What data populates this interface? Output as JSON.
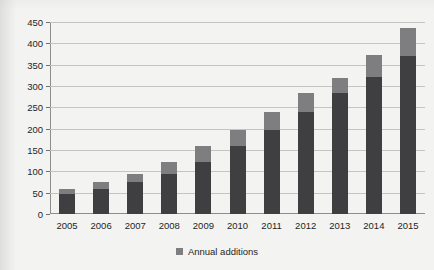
{
  "chart_data": {
    "type": "bar",
    "stacked": true,
    "title": "",
    "xlabel": "",
    "ylabel": "Wind power capacity (GW)",
    "categories": [
      "2005",
      "2006",
      "2007",
      "2008",
      "2009",
      "2010",
      "2011",
      "2012",
      "2013",
      "2014",
      "2015"
    ],
    "series": [
      {
        "name": "Cumulative capacity (previous year)",
        "values": [
          48,
          59,
          74,
          94,
          121,
          159,
          198,
          238,
          283,
          320,
          370
        ],
        "color": "#3f3f41"
      },
      {
        "name": "Annual additions",
        "values": [
          11,
          15,
          20,
          27,
          38,
          39,
          40,
          45,
          35,
          52,
          65
        ],
        "color": "#7e7e80"
      }
    ],
    "totals": [
      59,
      74,
      94,
      121,
      159,
      198,
      238,
      283,
      318,
      372,
      435
    ],
    "ylim": [
      0,
      450
    ],
    "yticks": [
      0,
      50,
      100,
      150,
      200,
      250,
      300,
      350,
      400,
      450
    ],
    "ytick_labels": [
      "0",
      "50",
      "100",
      "150",
      "200",
      "250",
      "300",
      "350",
      "400",
      "450"
    ],
    "grid": true,
    "legend_position": "bottom-center",
    "legend": [
      "Annual additions"
    ]
  },
  "legend": {
    "label": "Annual additions",
    "swatch_color": "#7e7e80"
  },
  "colors": {
    "base_segment": "#3f3f41",
    "addition_segment": "#7e7e80",
    "gridline": "#c4c4c2",
    "axis": "#8d8d8d",
    "background": "#f3f3f1"
  }
}
